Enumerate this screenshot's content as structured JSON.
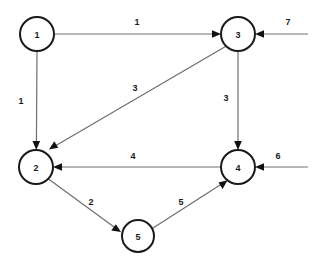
{
  "diagram": {
    "type": "directed-weighted-graph",
    "title": "",
    "background_color": "#ffffff",
    "node_stroke_color": "#1a1a1a",
    "edge_color": "#6e6e6e",
    "arrow_color": "#111111",
    "label_color": "#1a1a1a",
    "nodes": [
      {
        "id": "1",
        "label": "1",
        "cx": 37,
        "cy": 34,
        "r": 17
      },
      {
        "id": "2",
        "label": "2",
        "cx": 36,
        "cy": 167,
        "r": 17
      },
      {
        "id": "3",
        "label": "3",
        "cx": 238,
        "cy": 34,
        "r": 17
      },
      {
        "id": "4",
        "label": "4",
        "cx": 238,
        "cy": 167,
        "r": 17
      },
      {
        "id": "5",
        "label": "5",
        "cx": 138,
        "cy": 236,
        "r": 16
      }
    ],
    "edges": [
      {
        "id": "e1",
        "from": "1",
        "to": "3",
        "weight": "1",
        "label_x": 137,
        "label_y": 22
      },
      {
        "id": "e2",
        "from": "1",
        "to": "2",
        "weight": "1",
        "label_x": 21,
        "label_y": 101
      },
      {
        "id": "e3",
        "from": "3",
        "to": "2",
        "weight": "3",
        "label_x": 135,
        "label_y": 88
      },
      {
        "id": "e4",
        "from": "3",
        "to": "4",
        "weight": "3",
        "label_x": 226,
        "label_y": 98
      },
      {
        "id": "e5",
        "from": "4",
        "to": "2",
        "weight": "4",
        "label_x": 133,
        "label_y": 156
      },
      {
        "id": "e6",
        "from": "2",
        "to": "5",
        "weight": "2",
        "label_x": 91,
        "label_y": 202
      },
      {
        "id": "e7",
        "from": "5",
        "to": "4",
        "weight": "5",
        "label_x": 181,
        "label_y": 202
      }
    ],
    "external_inputs": [
      {
        "id": "in7",
        "to": "3",
        "weight": "7",
        "label_x": 288,
        "label_y": 22,
        "start_x": 308,
        "start_y": 34
      },
      {
        "id": "in6",
        "to": "4",
        "weight": "6",
        "label_x": 278,
        "label_y": 156,
        "start_x": 308,
        "start_y": 167
      }
    ]
  }
}
